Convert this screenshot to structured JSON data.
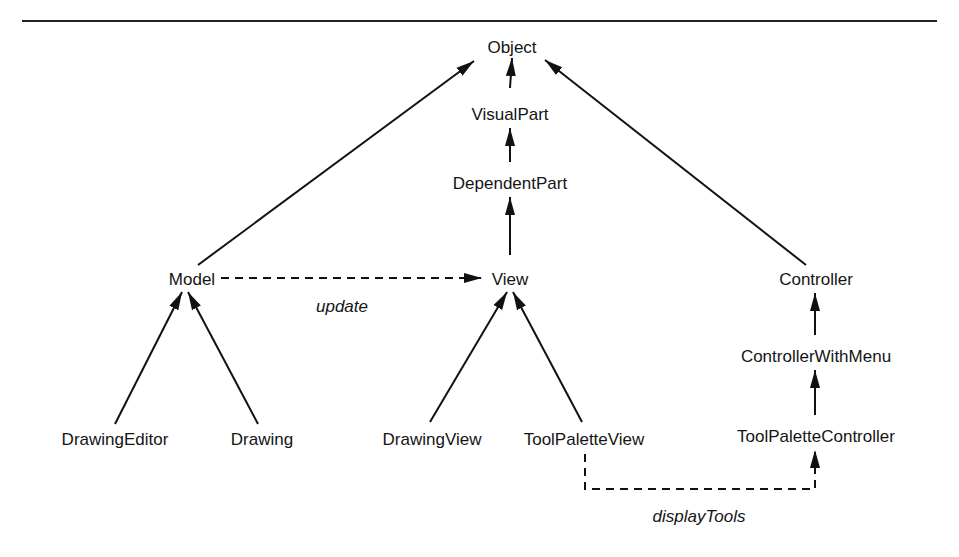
{
  "diagram": {
    "type": "class-hierarchy",
    "nodes": [
      {
        "id": "object",
        "label": "Object",
        "x": 512,
        "y": 48
      },
      {
        "id": "visualpart",
        "label": "VisualPart",
        "x": 510,
        "y": 115
      },
      {
        "id": "dependentpart",
        "label": "DependentPart",
        "x": 510,
        "y": 184
      },
      {
        "id": "model",
        "label": "Model",
        "x": 192,
        "y": 280
      },
      {
        "id": "view",
        "label": "View",
        "x": 510,
        "y": 280
      },
      {
        "id": "controller",
        "label": "Controller",
        "x": 816,
        "y": 280
      },
      {
        "id": "controllerwithmenu",
        "label": "ControllerWithMenu",
        "x": 816,
        "y": 357
      },
      {
        "id": "draweditor",
        "label": "DrawingEditor",
        "x": 115,
        "y": 440
      },
      {
        "id": "drawing",
        "label": "Drawing",
        "x": 262,
        "y": 440
      },
      {
        "id": "drawingview",
        "label": "DrawingView",
        "x": 432,
        "y": 440
      },
      {
        "id": "toolpaletteview",
        "label": "ToolPaletteView",
        "x": 584,
        "y": 440
      },
      {
        "id": "toolpalettecontroller",
        "label": "ToolPaletteController",
        "x": 816,
        "y": 437
      }
    ],
    "edges": [
      {
        "from": "model",
        "to": "object",
        "style": "solid"
      },
      {
        "from": "visualpart",
        "to": "object",
        "style": "solid"
      },
      {
        "from": "controller",
        "to": "object",
        "style": "solid"
      },
      {
        "from": "dependentpart",
        "to": "visualpart",
        "style": "solid"
      },
      {
        "from": "view",
        "to": "dependentpart",
        "style": "solid"
      },
      {
        "from": "draweditor",
        "to": "model",
        "style": "solid"
      },
      {
        "from": "drawing",
        "to": "model",
        "style": "solid"
      },
      {
        "from": "drawingview",
        "to": "view",
        "style": "solid"
      },
      {
        "from": "toolpaletteview",
        "to": "view",
        "style": "solid"
      },
      {
        "from": "controllerwithmenu",
        "to": "controller",
        "style": "solid"
      },
      {
        "from": "toolpalettecontroller",
        "to": "controllerwithmenu",
        "style": "solid"
      },
      {
        "from": "model",
        "to": "view",
        "style": "dashed",
        "label": "update"
      },
      {
        "from": "toolpaletteview",
        "to": "toolpalettecontroller",
        "style": "dashed",
        "label": "displayTools"
      }
    ],
    "edge_labels": {
      "update": "update",
      "displayTools": "displayTools"
    }
  }
}
